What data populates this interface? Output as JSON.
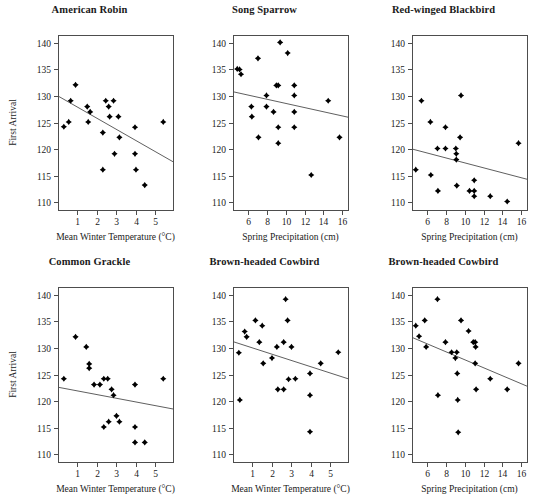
{
  "figure": {
    "width": 539,
    "height": 504,
    "background": "#ffffff",
    "marker_color": "#000000",
    "axis_color": "#4d4d4d",
    "text_color": "#1a1a1a",
    "rows": 2,
    "cols": 3
  },
  "axes_common": {
    "ylabel": "First Arrival",
    "ylim": [
      108.5,
      141.5
    ],
    "yticks": [
      110,
      115,
      120,
      125,
      130,
      135,
      140
    ],
    "ytick_labels": [
      "110",
      "115",
      "120",
      "125",
      "130",
      "135",
      "140"
    ],
    "temp_xlabel": "Mean Winter Temperature (°C)",
    "temp_xticks": [
      1,
      2,
      3,
      4,
      5
    ],
    "temp_xtick_labels": [
      "1",
      "2",
      "3",
      "4",
      "5"
    ],
    "temp_xlim": [
      0.0,
      5.9
    ],
    "precip_xlabel": "Spring Precipitation (cm)",
    "precip_xticks": [
      6,
      8,
      10,
      12,
      14,
      16
    ],
    "precip_xtick_labels": [
      "6",
      "8",
      "10",
      "12",
      "14",
      "16"
    ],
    "precip_xlim": [
      4.4,
      16.6
    ],
    "grid": false,
    "legend": "none"
  },
  "chart_data": [
    {
      "type": "scatter",
      "panel": 1,
      "title": "American Robin",
      "xlabel": "Mean Winter Temperature (°C)",
      "ylabel": "First Arrival",
      "xlim": [
        0.0,
        5.9
      ],
      "ylim": [
        108.5,
        141.5
      ],
      "xticks": [
        1,
        2,
        3,
        4,
        5
      ],
      "yticks": [
        110,
        115,
        120,
        125,
        130,
        135,
        140
      ],
      "show_ylabel": true,
      "points": [
        {
          "x": 0.3,
          "y": 124.2
        },
        {
          "x": 0.55,
          "y": 125.1
        },
        {
          "x": 0.65,
          "y": 129.1
        },
        {
          "x": 0.9,
          "y": 132.1
        },
        {
          "x": 1.5,
          "y": 128.0
        },
        {
          "x": 1.55,
          "y": 125.1
        },
        {
          "x": 1.65,
          "y": 127.0
        },
        {
          "x": 2.3,
          "y": 123.1
        },
        {
          "x": 2.3,
          "y": 116.1
        },
        {
          "x": 2.45,
          "y": 129.1
        },
        {
          "x": 2.6,
          "y": 128.0
        },
        {
          "x": 2.65,
          "y": 126.1
        },
        {
          "x": 2.85,
          "y": 129.1
        },
        {
          "x": 2.9,
          "y": 119.1
        },
        {
          "x": 3.1,
          "y": 126.1
        },
        {
          "x": 3.15,
          "y": 122.2
        },
        {
          "x": 3.95,
          "y": 124.1
        },
        {
          "x": 3.95,
          "y": 119.1
        },
        {
          "x": 4.0,
          "y": 116.1
        },
        {
          "x": 4.45,
          "y": 113.2
        },
        {
          "x": 5.4,
          "y": 125.1
        }
      ],
      "fit_line": {
        "x0": 0.0,
        "y0": 130.0,
        "x1": 5.9,
        "y1": 117.6
      }
    },
    {
      "type": "scatter",
      "panel": 2,
      "title": "Song Sparrow",
      "xlabel": "Spring Precipitation (cm)",
      "ylabel": "First Arrival",
      "xlim": [
        4.4,
        16.6
      ],
      "ylim": [
        108.5,
        141.5
      ],
      "xticks": [
        6,
        8,
        10,
        12,
        14,
        16
      ],
      "yticks": [
        110,
        115,
        120,
        125,
        130,
        135,
        140
      ],
      "show_ylabel": false,
      "points": [
        {
          "x": 4.85,
          "y": 135.1
        },
        {
          "x": 5.1,
          "y": 135.0
        },
        {
          "x": 5.25,
          "y": 134.1
        },
        {
          "x": 6.35,
          "y": 128.0
        },
        {
          "x": 6.4,
          "y": 126.1
        },
        {
          "x": 7.05,
          "y": 137.1
        },
        {
          "x": 7.1,
          "y": 122.2
        },
        {
          "x": 7.95,
          "y": 130.1
        },
        {
          "x": 7.95,
          "y": 128.0
        },
        {
          "x": 8.7,
          "y": 127.0
        },
        {
          "x": 9.0,
          "y": 132.0
        },
        {
          "x": 9.2,
          "y": 132.0
        },
        {
          "x": 9.2,
          "y": 124.1
        },
        {
          "x": 9.2,
          "y": 121.1
        },
        {
          "x": 9.4,
          "y": 140.1
        },
        {
          "x": 10.2,
          "y": 138.1
        },
        {
          "x": 10.9,
          "y": 132.0
        },
        {
          "x": 10.9,
          "y": 130.1
        },
        {
          "x": 10.9,
          "y": 127.0
        },
        {
          "x": 10.9,
          "y": 124.1
        },
        {
          "x": 12.7,
          "y": 115.1
        },
        {
          "x": 14.5,
          "y": 129.1
        },
        {
          "x": 15.7,
          "y": 122.2
        }
      ],
      "fit_line": {
        "x0": 4.4,
        "y0": 130.8,
        "x1": 16.6,
        "y1": 126.0
      }
    },
    {
      "type": "scatter",
      "panel": 3,
      "title": "Red-winged Blackbird",
      "xlabel": "Spring Precipitation (cm)",
      "ylabel": "First Arrival",
      "xlim": [
        4.4,
        16.6
      ],
      "ylim": [
        108.5,
        141.5
      ],
      "xticks": [
        6,
        8,
        10,
        12,
        14,
        16
      ],
      "yticks": [
        110,
        115,
        120,
        125,
        130,
        135,
        140
      ],
      "show_ylabel": false,
      "points": [
        {
          "x": 4.8,
          "y": 116.1
        },
        {
          "x": 5.4,
          "y": 129.1
        },
        {
          "x": 6.35,
          "y": 125.1
        },
        {
          "x": 6.4,
          "y": 115.1
        },
        {
          "x": 7.1,
          "y": 120.1
        },
        {
          "x": 7.15,
          "y": 112.1
        },
        {
          "x": 7.95,
          "y": 124.1
        },
        {
          "x": 7.95,
          "y": 120.1
        },
        {
          "x": 9.05,
          "y": 120.1
        },
        {
          "x": 9.1,
          "y": 119.1
        },
        {
          "x": 9.1,
          "y": 118.0
        },
        {
          "x": 9.15,
          "y": 113.1
        },
        {
          "x": 9.5,
          "y": 122.2
        },
        {
          "x": 9.6,
          "y": 130.1
        },
        {
          "x": 10.5,
          "y": 112.1
        },
        {
          "x": 11.0,
          "y": 114.1
        },
        {
          "x": 11.0,
          "y": 112.1
        },
        {
          "x": 11.0,
          "y": 111.1
        },
        {
          "x": 12.7,
          "y": 111.1
        },
        {
          "x": 14.5,
          "y": 110.1
        },
        {
          "x": 15.7,
          "y": 121.1
        }
      ],
      "fit_line": {
        "x0": 4.4,
        "y0": 120.0,
        "x1": 16.6,
        "y1": 114.3
      }
    },
    {
      "type": "scatter",
      "panel": 4,
      "title": "Common Grackle",
      "xlabel": "Mean Winter Temperature (°C)",
      "ylabel": "First Arrival",
      "xlim": [
        0.0,
        5.9
      ],
      "ylim": [
        108.5,
        141.5
      ],
      "xticks": [
        1,
        2,
        3,
        4,
        5
      ],
      "yticks": [
        110,
        115,
        120,
        125,
        130,
        135,
        140
      ],
      "show_ylabel": true,
      "points": [
        {
          "x": 0.3,
          "y": 124.2
        },
        {
          "x": 0.9,
          "y": 132.1
        },
        {
          "x": 1.45,
          "y": 130.2
        },
        {
          "x": 1.6,
          "y": 127.0
        },
        {
          "x": 1.6,
          "y": 126.2
        },
        {
          "x": 1.85,
          "y": 123.1
        },
        {
          "x": 2.15,
          "y": 123.1
        },
        {
          "x": 2.35,
          "y": 124.2
        },
        {
          "x": 2.35,
          "y": 115.1
        },
        {
          "x": 2.55,
          "y": 124.2
        },
        {
          "x": 2.6,
          "y": 116.1
        },
        {
          "x": 2.75,
          "y": 122.2
        },
        {
          "x": 2.85,
          "y": 121.1
        },
        {
          "x": 3.0,
          "y": 117.2
        },
        {
          "x": 3.15,
          "y": 116.1
        },
        {
          "x": 3.95,
          "y": 123.1
        },
        {
          "x": 3.95,
          "y": 115.1
        },
        {
          "x": 3.95,
          "y": 112.2
        },
        {
          "x": 4.45,
          "y": 112.2
        },
        {
          "x": 5.4,
          "y": 124.2
        }
      ],
      "fit_line": {
        "x0": 0.0,
        "y0": 122.6,
        "x1": 5.9,
        "y1": 118.5
      }
    },
    {
      "type": "scatter",
      "panel": 5,
      "title": "Brown-headed Cowbird",
      "xlabel": "Mean Winter Temperature (°C)",
      "ylabel": "First Arrival",
      "xlim": [
        0.0,
        5.9
      ],
      "ylim": [
        108.5,
        141.5
      ],
      "xticks": [
        1,
        2,
        3,
        4,
        5
      ],
      "yticks": [
        110,
        115,
        120,
        125,
        130,
        135,
        140
      ],
      "show_ylabel": false,
      "points": [
        {
          "x": 0.3,
          "y": 129.1
        },
        {
          "x": 0.35,
          "y": 120.2
        },
        {
          "x": 0.6,
          "y": 133.1
        },
        {
          "x": 0.7,
          "y": 132.1
        },
        {
          "x": 1.15,
          "y": 135.2
        },
        {
          "x": 1.35,
          "y": 131.1
        },
        {
          "x": 1.5,
          "y": 134.2
        },
        {
          "x": 1.55,
          "y": 127.1
        },
        {
          "x": 2.0,
          "y": 128.1
        },
        {
          "x": 2.25,
          "y": 130.2
        },
        {
          "x": 2.3,
          "y": 122.2
        },
        {
          "x": 2.6,
          "y": 131.1
        },
        {
          "x": 2.6,
          "y": 122.2
        },
        {
          "x": 2.7,
          "y": 139.2
        },
        {
          "x": 2.8,
          "y": 135.2
        },
        {
          "x": 2.85,
          "y": 124.1
        },
        {
          "x": 3.0,
          "y": 130.2
        },
        {
          "x": 3.2,
          "y": 124.2
        },
        {
          "x": 3.95,
          "y": 125.2
        },
        {
          "x": 3.95,
          "y": 121.1
        },
        {
          "x": 3.95,
          "y": 114.2
        },
        {
          "x": 4.5,
          "y": 127.1
        },
        {
          "x": 5.4,
          "y": 129.2
        }
      ],
      "fit_line": {
        "x0": 0.0,
        "y0": 131.2,
        "x1": 5.9,
        "y1": 124.2
      }
    },
    {
      "type": "scatter",
      "panel": 6,
      "title": "Brown-headed Cowbird",
      "xlabel": "Spring Precipitation (cm)",
      "ylabel": "First Arrival",
      "xlim": [
        4.4,
        16.6
      ],
      "ylim": [
        108.5,
        141.5
      ],
      "xticks": [
        6,
        8,
        10,
        12,
        14,
        16
      ],
      "yticks": [
        110,
        115,
        120,
        125,
        130,
        135,
        140
      ],
      "show_ylabel": false,
      "points": [
        {
          "x": 4.8,
          "y": 134.2
        },
        {
          "x": 5.15,
          "y": 132.2
        },
        {
          "x": 5.75,
          "y": 135.2
        },
        {
          "x": 5.9,
          "y": 130.2
        },
        {
          "x": 7.1,
          "y": 139.2
        },
        {
          "x": 7.15,
          "y": 121.1
        },
        {
          "x": 7.95,
          "y": 131.1
        },
        {
          "x": 8.6,
          "y": 129.2
        },
        {
          "x": 9.0,
          "y": 128.1
        },
        {
          "x": 9.15,
          "y": 129.2
        },
        {
          "x": 9.2,
          "y": 125.2
        },
        {
          "x": 9.25,
          "y": 120.2
        },
        {
          "x": 9.3,
          "y": 114.1
        },
        {
          "x": 9.6,
          "y": 135.2
        },
        {
          "x": 10.4,
          "y": 133.2
        },
        {
          "x": 10.9,
          "y": 131.1
        },
        {
          "x": 11.1,
          "y": 131.1
        },
        {
          "x": 11.15,
          "y": 130.2
        },
        {
          "x": 11.1,
          "y": 127.1
        },
        {
          "x": 11.2,
          "y": 122.2
        },
        {
          "x": 12.7,
          "y": 124.2
        },
        {
          "x": 14.5,
          "y": 122.2
        },
        {
          "x": 15.7,
          "y": 127.1
        }
      ],
      "fit_line": {
        "x0": 4.4,
        "y0": 132.0,
        "x1": 16.6,
        "y1": 122.8
      }
    }
  ]
}
